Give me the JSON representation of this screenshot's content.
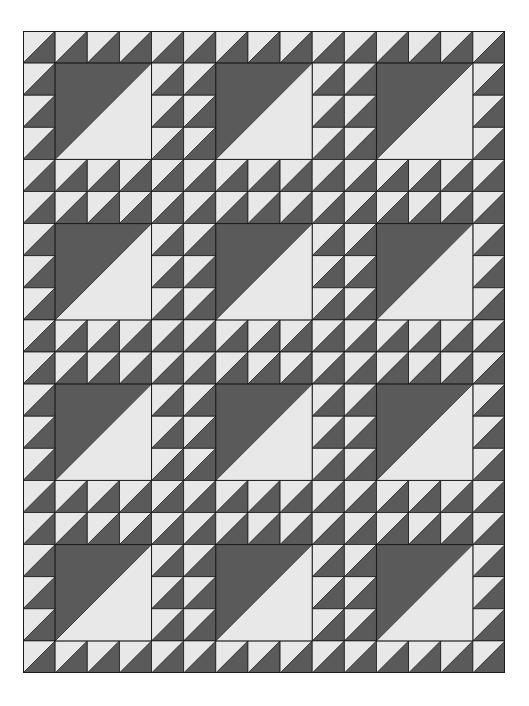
{
  "quilt": {
    "name": "Lady of the Lake quilt layout",
    "cols": 15,
    "rows": 20,
    "cell_w": 32.133,
    "cell_h": 32.1,
    "block_period": 5,
    "big_square_span": 3,
    "big_square_offset": 1,
    "big_square_cols": [
      1,
      6,
      11
    ],
    "big_square_rows": [
      1,
      6,
      11,
      16
    ],
    "colors": {
      "dark": "#5a5a5a",
      "light": "#e8e8e8",
      "seam": "#1a1a1a",
      "background": "#ffffff"
    },
    "hst_orientation": "light-top-left / dark-bottom-right",
    "big_square_orientation": "dark-top-left / light-bottom-right"
  }
}
